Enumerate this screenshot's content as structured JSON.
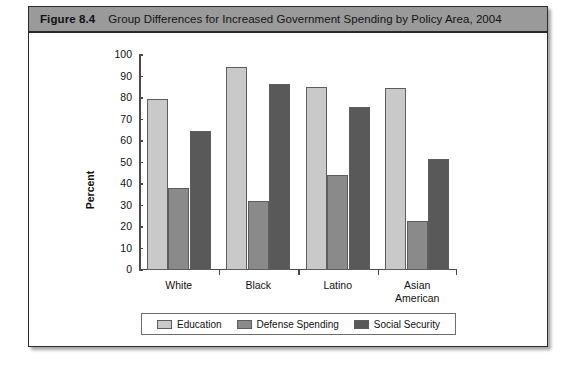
{
  "figure": {
    "number_label": "Figure 8.4",
    "title": "Group Differences for Increased Government Spending by Policy Area, 2004",
    "header_bg": "#9a9a9a",
    "border_color": "#2b2b2b"
  },
  "chart_data": {
    "type": "bar",
    "title": "Group Differences for Increased Government Spending by Policy Area, 2004",
    "xlabel": "",
    "ylabel": "Percent",
    "ylim": [
      0,
      100
    ],
    "ytick_step": 10,
    "yticks": [
      0,
      10,
      20,
      30,
      40,
      50,
      60,
      70,
      80,
      90,
      100
    ],
    "categories": [
      "White",
      "Black",
      "Latino",
      "Asian\nAmerican"
    ],
    "grid": false,
    "legend_position": "bottom",
    "series": [
      {
        "name": "Education",
        "color": "#c9c9c9",
        "values": [
          79.5,
          94.5,
          85,
          84.5
        ]
      },
      {
        "name": "Defense Spending",
        "color": "#8a8a8a",
        "values": [
          38,
          32,
          44,
          23
        ]
      },
      {
        "name": "Social Security",
        "color": "#595959",
        "values": [
          64.5,
          86.5,
          76,
          51.5
        ]
      }
    ]
  },
  "source_note": ""
}
